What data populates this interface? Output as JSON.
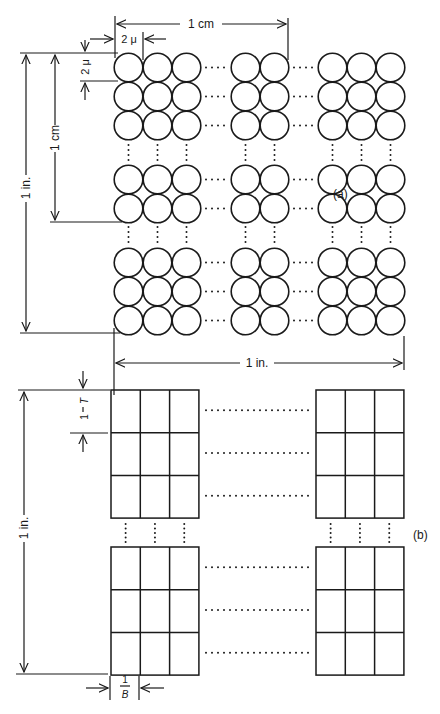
{
  "diagram": {
    "panel_a": {
      "label": "(a)",
      "dim_top": "1 cm",
      "dim_cell_width": "2 μ",
      "dim_cell_height": "2 μ",
      "dim_left_inner": "1 cm",
      "dim_left_outer": "1 in.",
      "dim_bottom": "1 in.",
      "element": "circle",
      "block_rows": 3,
      "block_cols": 3
    },
    "panel_b": {
      "label": "(b)",
      "dim_left": "1 in.",
      "dim_row_height_num": "1",
      "dim_row_height_den": "T",
      "dim_col_width_num": "1",
      "dim_col_width_den": "B",
      "element": "rectangle",
      "block_rows": 3,
      "block_cols": 3
    }
  }
}
